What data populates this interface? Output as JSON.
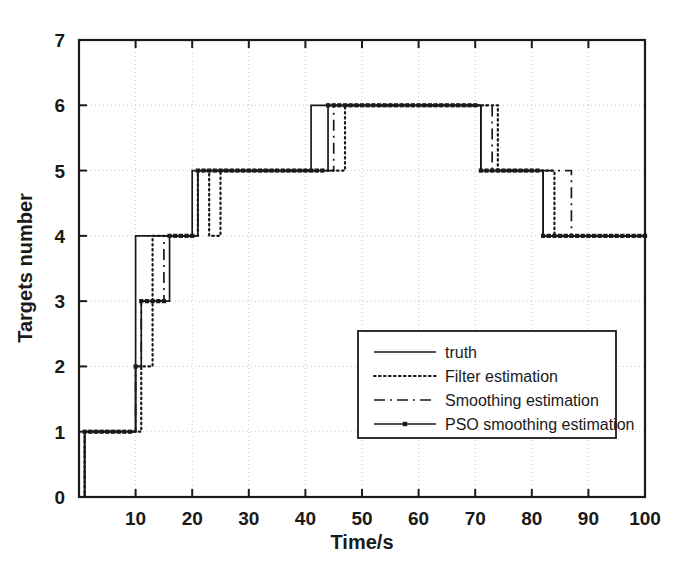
{
  "chart_data": {
    "type": "line",
    "title": "",
    "subtitle": "",
    "xlabel": "Time/s",
    "ylabel": "Targets number",
    "xlim": [
      0,
      100
    ],
    "ylim": [
      0,
      7
    ],
    "xticks": [
      0,
      10,
      20,
      30,
      40,
      50,
      60,
      70,
      80,
      90,
      100
    ],
    "yticks": [
      0,
      1,
      2,
      3,
      4,
      5,
      6,
      7
    ],
    "xticklabels": [
      "0",
      "10",
      "20",
      "30",
      "40",
      "50",
      "60",
      "70",
      "80",
      "90",
      "100"
    ],
    "yticklabels": [
      "0",
      "1",
      "2",
      "3",
      "4",
      "5",
      "6",
      "7"
    ],
    "grid": true,
    "grid_style": "dotted",
    "grid_color": "#c8c8c8",
    "legend_position": "center-right",
    "axes_color": "#1a1a1a",
    "background": "#ffffff",
    "step_type": "post",
    "series": [
      {
        "name": "truth",
        "style": "solid",
        "color": "#1a1a1a",
        "marker": "none",
        "x": [
          0,
          1,
          1,
          10,
          10,
          20,
          20,
          41,
          41,
          71,
          71,
          82,
          82,
          100
        ],
        "y": [
          0,
          0,
          1,
          1,
          4,
          4,
          5,
          5,
          6,
          6,
          5,
          5,
          4,
          4
        ]
      },
      {
        "name": "Filter estimation",
        "style": "dotted",
        "color": "#1a1a1a",
        "marker": "none",
        "x": [
          0,
          1,
          1,
          11,
          11,
          13,
          13,
          21,
          21,
          23,
          23,
          25,
          25,
          47,
          47,
          74,
          74,
          84,
          84,
          100
        ],
        "y": [
          0,
          0,
          1,
          1,
          2,
          2,
          4,
          4,
          5,
          5,
          4,
          4,
          5,
          5,
          6,
          6,
          5,
          5,
          4,
          4
        ]
      },
      {
        "name": "Smoothing estimation",
        "style": "dashdot",
        "color": "#1a1a1a",
        "marker": "none",
        "x": [
          0,
          1,
          1,
          10,
          10,
          11,
          11,
          15,
          15,
          16,
          16,
          21,
          21,
          45,
          45,
          73,
          73,
          87,
          87,
          100
        ],
        "y": [
          0,
          0,
          1,
          1,
          2,
          2,
          3,
          3,
          4,
          4,
          4,
          4,
          5,
          5,
          6,
          6,
          5,
          5,
          4,
          4
        ]
      },
      {
        "name": "PSO smoothing estimation",
        "style": "solid-marker",
        "color": "#1a1a1a",
        "marker": "square",
        "x": [
          0,
          1,
          1,
          10,
          10,
          11,
          11,
          16,
          16,
          21,
          21,
          44,
          44,
          71,
          71,
          82,
          82,
          100
        ],
        "y": [
          0,
          0,
          1,
          1,
          2,
          2,
          3,
          3,
          4,
          4,
          5,
          5,
          6,
          6,
          5,
          5,
          4,
          4
        ]
      }
    ],
    "legend": [
      {
        "label": "truth",
        "style": "solid"
      },
      {
        "label": "Filter estimation",
        "style": "dotted"
      },
      {
        "label": "Smoothing estimation",
        "style": "dashdot"
      },
      {
        "label": "PSO smoothing estimation",
        "style": "solid-marker"
      }
    ]
  }
}
